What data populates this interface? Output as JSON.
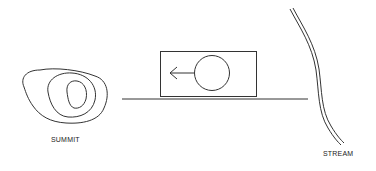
{
  "diagram": {
    "labels": {
      "summit": "SUMMIT",
      "stream": "STREAM"
    },
    "elements": [
      {
        "id": "summit",
        "type": "contour-lines",
        "rings": 3
      },
      {
        "id": "ground-line",
        "type": "line"
      },
      {
        "id": "rolling-box",
        "type": "box-with-wheel"
      },
      {
        "id": "direction-arrow",
        "type": "arrow",
        "direction": "left"
      },
      {
        "id": "stream",
        "type": "double-line"
      }
    ],
    "colors": {
      "stroke": "#333333",
      "background": "#ffffff"
    }
  }
}
